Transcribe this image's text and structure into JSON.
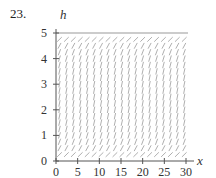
{
  "problem": {
    "number": "23."
  },
  "chart_data": {
    "type": "slope-field",
    "title": "",
    "xlabel": "x",
    "ylabel": "h",
    "xlim": [
      0,
      30
    ],
    "ylim": [
      0,
      5
    ],
    "x_ticks": [
      0,
      5,
      10,
      15,
      20,
      25,
      30
    ],
    "y_ticks": [
      0,
      1,
      2,
      3,
      4,
      5
    ],
    "grid": false,
    "slope_rule": "dh/dx proportional to h*(5-h)",
    "equilibria": [
      0,
      5
    ],
    "field_color": "#9a9a9a",
    "axis_color": "#555555"
  }
}
